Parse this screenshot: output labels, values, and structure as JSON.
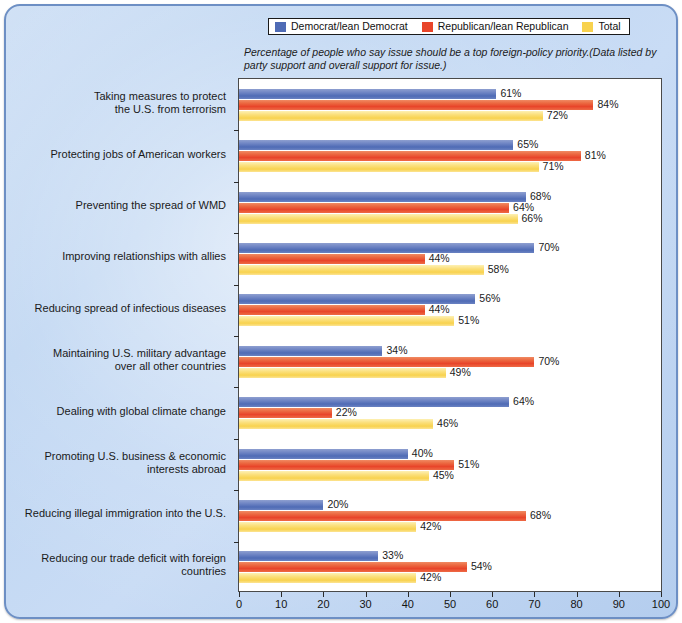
{
  "legend": {
    "items": [
      {
        "label": "Democrat/lean Democrat",
        "color": "#4f6bb5"
      },
      {
        "label": "Republican/lean Republican",
        "color": "#e8452a"
      },
      {
        "label": "Total",
        "color": "#f8d24e"
      }
    ]
  },
  "subtitle": "Percentage of people who say issue should be a top foreign-policy priority.(Data listed by party support and overall support for issue.)",
  "chart_data": {
    "type": "bar",
    "orientation": "horizontal",
    "title": "",
    "subtitle": "Percentage of people who say issue should be a top foreign-policy priority.(Data listed by party support and overall support for issue.)",
    "xlabel": "",
    "ylabel": "",
    "xlim": [
      0,
      100
    ],
    "xticks": [
      0,
      10,
      20,
      30,
      40,
      50,
      60,
      70,
      80,
      90,
      100
    ],
    "xtick_labels": [
      "0",
      "10",
      "20",
      "30",
      "40",
      "50",
      "60",
      "70",
      "80",
      "90",
      "100"
    ],
    "grid": false,
    "legend_position": "top",
    "value_suffix": "%",
    "categories": [
      "Taking measures to protect the U.S. from terrorism",
      "Protecting jobs of American workers",
      "Preventing the spread of WMD",
      "Improving relationships with allies",
      "Reducing spread of infectious diseases",
      "Maintaining U.S. military advantage over all other countries",
      "Dealing with global climate change",
      "Promoting U.S. business & economic interests abroad",
      "Reducing illegal immigration into the U.S.",
      "Reducing our trade deficit with foreign countries"
    ],
    "category_lines": [
      [
        "Taking measures to protect",
        "the U.S. from terrorism"
      ],
      [
        "Protecting jobs of American workers"
      ],
      [
        "Preventing the spread of WMD"
      ],
      [
        "Improving relationships with allies"
      ],
      [
        "Reducing spread of infectious diseases"
      ],
      [
        "Maintaining U.S. military advantage",
        "over all other countries"
      ],
      [
        "Dealing with global climate change"
      ],
      [
        "Promoting U.S. business & economic",
        "interests abroad"
      ],
      [
        "Reducing illegal immigration into the U.S."
      ],
      [
        "Reducing our trade deficit with foreign",
        "countries"
      ]
    ],
    "series": [
      {
        "name": "Democrat/lean Democrat",
        "color": "#4f6bb5",
        "values": [
          61,
          65,
          68,
          70,
          56,
          34,
          64,
          40,
          20,
          33
        ],
        "labels": [
          "61%",
          "65%",
          "68%",
          "70%",
          "56%",
          "34%",
          "64%",
          "40%",
          "20%",
          "33%"
        ]
      },
      {
        "name": "Republican/lean Republican",
        "color": "#e8452a",
        "values": [
          84,
          81,
          64,
          44,
          44,
          70,
          22,
          51,
          68,
          54
        ],
        "labels": [
          "84%",
          "81%",
          "64%",
          "44%",
          "44%",
          "70%",
          "22%",
          "51%",
          "68%",
          "54%"
        ]
      },
      {
        "name": "Total",
        "color": "#f8d24e",
        "values": [
          72,
          71,
          66,
          58,
          51,
          49,
          46,
          45,
          42,
          42
        ],
        "labels": [
          "72%",
          "71%",
          "66%",
          "58%",
          "51%",
          "49%",
          "46%",
          "45%",
          "42%",
          "42%"
        ]
      }
    ]
  }
}
